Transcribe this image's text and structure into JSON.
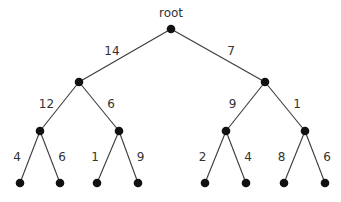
{
  "diagram": {
    "type": "binary-tree",
    "root_label": "root",
    "colors": {
      "node": "#111111",
      "edge": "#3a3a3a",
      "text": "#333333"
    },
    "nodes": [
      {
        "id": "root",
        "parent": null
      },
      {
        "id": "L",
        "parent": "root",
        "weight": "14"
      },
      {
        "id": "R",
        "parent": "root",
        "weight": "7"
      },
      {
        "id": "LL",
        "parent": "L",
        "weight": "12"
      },
      {
        "id": "LR",
        "parent": "L",
        "weight": "6"
      },
      {
        "id": "RL",
        "parent": "R",
        "weight": "9"
      },
      {
        "id": "RR",
        "parent": "R",
        "weight": "1"
      },
      {
        "id": "LLL",
        "parent": "LL",
        "weight": "4"
      },
      {
        "id": "LLR",
        "parent": "LL",
        "weight": "6"
      },
      {
        "id": "LRL",
        "parent": "LR",
        "weight": "1"
      },
      {
        "id": "LRR",
        "parent": "LR",
        "weight": "9"
      },
      {
        "id": "RLL",
        "parent": "RL",
        "weight": "2"
      },
      {
        "id": "RLR",
        "parent": "RL",
        "weight": "4"
      },
      {
        "id": "RRL",
        "parent": "RR",
        "weight": "8"
      },
      {
        "id": "RRR",
        "parent": "RR",
        "weight": "6"
      }
    ]
  }
}
